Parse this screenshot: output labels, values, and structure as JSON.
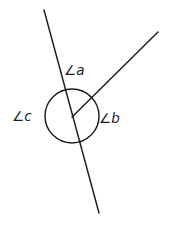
{
  "figure": {
    "background_color": "#ffffff",
    "stroke_color": "#1d1d1f",
    "width": 171,
    "height": 230,
    "labels": {
      "angle_a": "∠a",
      "angle_b": "∠b",
      "angle_c": "∠c"
    }
  },
  "chart_data": {
    "type": "diagram",
    "vertex": {
      "x": 72,
      "y": 117
    },
    "circle": {
      "cx": 72,
      "cy": 116,
      "r": 27
    },
    "elements": [
      {
        "name": "transversal-line",
        "kind": "line",
        "x1": 44,
        "y1": 10,
        "x2": 99,
        "y2": 213
      },
      {
        "name": "upper-right-ray",
        "kind": "ray",
        "x1": 72,
        "y1": 117,
        "x2": 158,
        "y2": 32
      }
    ],
    "annotations": [
      {
        "text": "∠a",
        "x": 64,
        "y": 64,
        "region": "top-between-line-and-ray"
      },
      {
        "text": "∠b",
        "x": 99,
        "y": 112,
        "region": "right-below-ray"
      },
      {
        "text": "∠c",
        "x": 12,
        "y": 110,
        "region": "left-of-line"
      }
    ],
    "grid": false,
    "legend": null
  }
}
